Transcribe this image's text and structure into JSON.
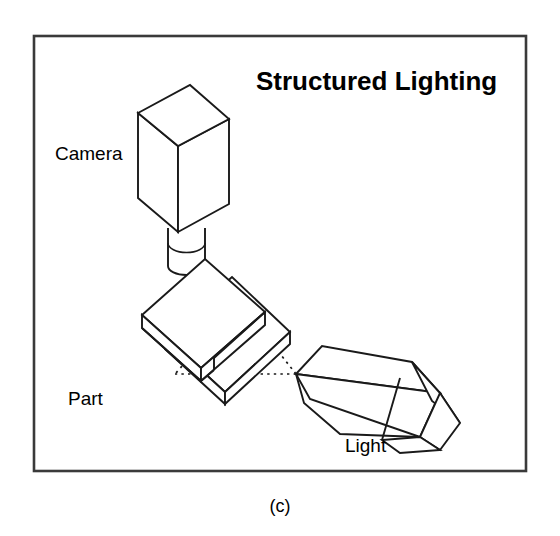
{
  "figure": {
    "title": "Structured Lighting",
    "caption": "(c)",
    "background_color": "#ffffff",
    "frame_color": "#3a3a3a",
    "ink_color": "#1a1a1a",
    "labels": {
      "camera": "Camera",
      "part": "Part",
      "light": "Light"
    },
    "components": [
      {
        "name": "camera",
        "label": "Camera",
        "description": "rectangular camera body with cylindrical lens pointing downward"
      },
      {
        "name": "part",
        "label": "Part",
        "description": "stepped rectangular plate being inspected"
      },
      {
        "name": "light",
        "label": "Light",
        "description": "tapered structured light projector aimed at the part"
      },
      {
        "name": "light-beam",
        "label": "",
        "description": "dotted triangular light beam projected from light onto part surface"
      }
    ]
  }
}
